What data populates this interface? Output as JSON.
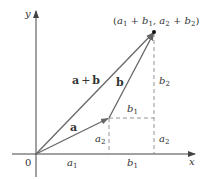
{
  "diagram": {
    "colors": {
      "axis": "#444444",
      "vector": "#666666",
      "dashed": "#888888",
      "text": "#333333",
      "point": "#111111"
    },
    "axes": {
      "x_label": "x",
      "y_label": "y",
      "origin_label": "0"
    },
    "vectors": {
      "a_label": "a",
      "b_label": "b",
      "sum_label_a": "a",
      "sum_label_plus": "+",
      "sum_label_b": "b"
    },
    "point_label": {
      "open": "(",
      "a1": "a",
      "sub1": "1",
      "plus1": " + ",
      "b1": "b",
      "sub2": "1",
      "comma": ", ",
      "a2": "a",
      "sub3": "2",
      "plus2": " + ",
      "b2": "b",
      "sub4": "2",
      "close": ")"
    },
    "component_labels": {
      "a1_x": {
        "base": "a",
        "sub": "1"
      },
      "b1_x": {
        "base": "b",
        "sub": "1"
      },
      "a2_left": {
        "base": "a",
        "sub": "2"
      },
      "a2_right": {
        "base": "a",
        "sub": "2"
      },
      "b1_mid": {
        "base": "b",
        "sub": "1"
      },
      "b2_right": {
        "base": "b",
        "sub": "2"
      }
    }
  }
}
